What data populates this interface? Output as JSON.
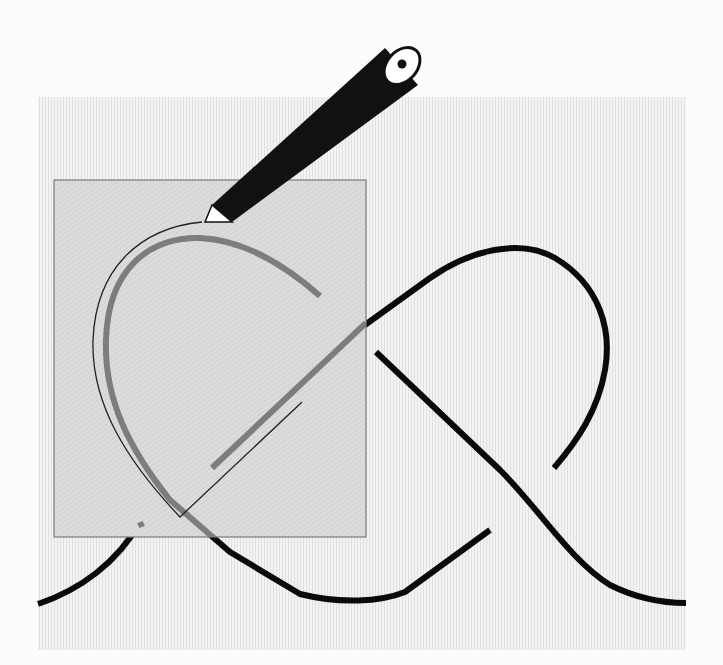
{
  "illustration": {
    "subject": "knot-tracing-with-pencil",
    "colors": {
      "page_background": "#fcfcfc",
      "panel_background": "#efefef",
      "panel_stripe": "#e2e2e2",
      "overlay_fill": "#d9d9d9",
      "overlay_border": "#7a7a7a",
      "knot_strand": "#0a0a0a",
      "knot_strand_under_overlay": "#7d7d7d",
      "pencil_body": "#111111",
      "pencil_tip": "#ffffff",
      "traced_line": "#222222"
    },
    "panel": {
      "x": 38,
      "y": 97,
      "width": 648,
      "height": 553
    },
    "overlay_square": {
      "x": 54,
      "y": 180,
      "width": 312,
      "height": 357
    },
    "pencil": {
      "tip": [
        203,
        222
      ],
      "end": [
        403,
        63
      ],
      "width": 40
    }
  }
}
